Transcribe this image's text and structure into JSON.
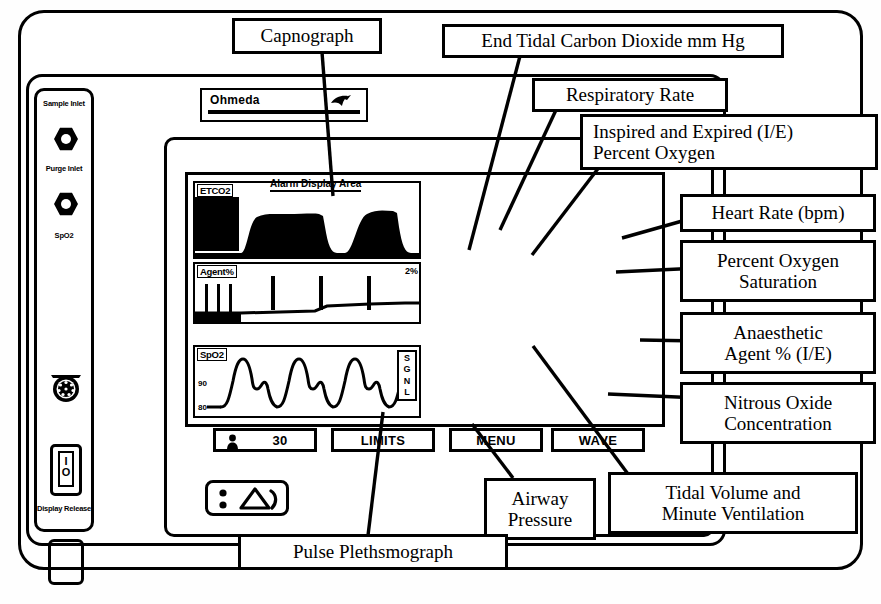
{
  "device": {
    "brand": "Ohmeda",
    "left_panel": {
      "sample_inlet": "Sample\nInlet",
      "sample_inlet_line1": "Sample",
      "sample_inlet_line2": "Inlet",
      "purge_inlet_line1": "Purge",
      "purge_inlet_line2": "Inlet",
      "spo2_port": "SpO2",
      "power_on": "I",
      "power_off": "O",
      "display_release_line1": "Display",
      "display_release_line2": "Release"
    },
    "screen": {
      "alarm_display_area": "Alarm Display Area",
      "waveforms": [
        {
          "tag": "ETCO2",
          "scale_top": "",
          "scale_bottom": ""
        },
        {
          "tag": "Agent%",
          "scale_right": "2%"
        },
        {
          "tag": "SpO2",
          "scale_top": "90",
          "scale_bottom": "80",
          "signal": "SGNL"
        }
      ],
      "co2": {
        "title": "CO",
        "title_sub": "2",
        "unit": "mmHg",
        "rr_label": "RR",
        "rr_value": "12",
        "value_inspired": "1",
        "value_separator": "/",
        "value_expired": "39",
        "bottom_unit": "mmHg"
      },
      "o2": {
        "title": "O",
        "title_sub": "2",
        "value_inspired": "48",
        "value_separator": "/",
        "value_expired": "44",
        "bottom_unit": "%"
      },
      "spo2": {
        "title": "SpO",
        "title_sub": "2",
        "heart_icon": "heart-icon",
        "pr_label": "PR",
        "pr_value": "66",
        "value": "99",
        "bottom_unit": "%"
      },
      "ventilation": {
        "tv_label": "TV",
        "tv_value": "740",
        "tv_unit": "mL",
        "patient_mode": "ADULT",
        "mv_label": "MV",
        "mv_value": "8.9",
        "mv_unit": "L"
      },
      "agent": {
        "name": "Isoflurane",
        "ie_label": "I/E",
        "ie_value": "0.6/0.5%"
      },
      "paw": {
        "title": "PAW",
        "value": "18/2 (6)",
        "unit_line1": "cm",
        "unit_line2": "H2O"
      },
      "n2o": {
        "title": "N",
        "title_sub": "2",
        "title_tail": "O",
        "value": "51%"
      },
      "o2_oxt": {
        "title": "O",
        "title_sub": "2",
        "title_tail": "OXT",
        "value": "48%"
      },
      "softkeys": [
        {
          "name": "rate-softkey",
          "label": "30",
          "icon": "person-icon"
        },
        {
          "name": "limits-softkey",
          "label": "LIMITS",
          "icon": ""
        },
        {
          "name": "menu-softkey",
          "label": "MENU",
          "icon": ""
        },
        {
          "name": "wave-softkey",
          "label": "WAVE",
          "icon": ""
        }
      ]
    },
    "alarm_silence_icon": "alarm-silence-icon"
  },
  "annotations": [
    {
      "id": "capnograph",
      "label": "Capnograph",
      "lines": [
        "Capnograph"
      ]
    },
    {
      "id": "etco2",
      "label": "End Tidal Carbon Dioxide mm Hg",
      "lines": [
        "End Tidal Carbon Dioxide mm Hg"
      ]
    },
    {
      "id": "resp-rate",
      "label": "Respiratory Rate",
      "lines": [
        "Respiratory Rate"
      ]
    },
    {
      "id": "ie-oxygen",
      "label": "Inspired and Expired (I/E) Percent Oxygen",
      "lines": [
        "Inspired and Expired (I/E)",
        "Percent Oxygen"
      ]
    },
    {
      "id": "heart-rate",
      "label": "Heart Rate (bpm)",
      "lines": [
        "Heart Rate (bpm)"
      ]
    },
    {
      "id": "spo2-sat",
      "label": "Percent Oxygen Saturation",
      "lines": [
        "Percent Oxygen",
        "Saturation"
      ]
    },
    {
      "id": "anaesthetic-agent",
      "label": "Anaesthetic Agent % (I/E)",
      "lines": [
        "Anaesthetic",
        "Agent % (I/E)"
      ]
    },
    {
      "id": "nitrous-oxide",
      "label": "Nitrous Oxide Concentration",
      "lines": [
        "Nitrous Oxide",
        "Concentration"
      ]
    },
    {
      "id": "airway-pressure",
      "label": "Airway Pressure",
      "lines": [
        "Airway",
        "Pressure"
      ]
    },
    {
      "id": "tidal-volume",
      "label": "Tidal Volume and Minute Ventilation",
      "lines": [
        "Tidal Volume and",
        "Minute Ventilation"
      ]
    },
    {
      "id": "pulse-pleth",
      "label": "Pulse Plethsmograph",
      "lines": [
        "Pulse Plethsmograph"
      ]
    }
  ],
  "colors": {
    "ink": "#000000",
    "paper": "#ffffff"
  }
}
